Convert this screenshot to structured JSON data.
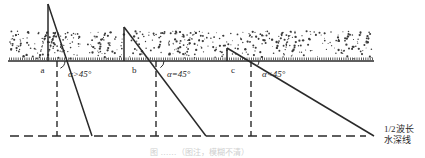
{
  "figure": {
    "colors": {
      "line": "#2a2a2a",
      "sediment": "#3a3a3a",
      "caption": "#cfcfcf",
      "background": "#ffffff"
    },
    "cases": [
      {
        "id": "a",
        "label": "a",
        "angle_label": "α>45°",
        "apex": [
          48,
          4
        ],
        "base_left": [
          48,
          61
        ],
        "cross": [
          57,
          61
        ],
        "end": [
          92,
          136
        ]
      },
      {
        "id": "b",
        "label": "b",
        "angle_label": "α=45°",
        "apex": [
          124,
          27
        ],
        "base_left": [
          124,
          61
        ],
        "cross": [
          156,
          61
        ],
        "end": [
          206,
          136
        ]
      },
      {
        "id": "c",
        "label": "c",
        "angle_label": "α<45°",
        "apex": [
          227,
          48
        ],
        "base_left": [
          227,
          61
        ],
        "cross": [
          251,
          61
        ],
        "end": [
          374,
          136
        ]
      }
    ],
    "seabed_line": {
      "y": 61,
      "x1": 8,
      "x2": 374
    },
    "depth_line": {
      "label_line1": "1/2波长",
      "label_line2": "水深线",
      "y": 136,
      "x1": 10,
      "x2": 366
    },
    "caption": "图 ……（图注，模糊不清）"
  }
}
